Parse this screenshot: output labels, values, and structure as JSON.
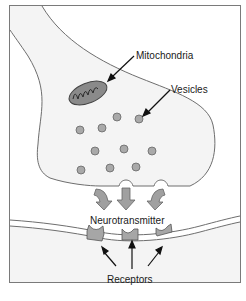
{
  "diagram": {
    "labels": {
      "mitochondria": "Mitochondria",
      "vesicles": "Vesicles",
      "neurotransmitter": "Neurotransmitter",
      "receptors": "Receptors"
    },
    "colors": {
      "background": "#ffffff",
      "cell_fill": "#f4f4f4",
      "outline": "#6e6e6e",
      "vesicle_fill": "#a9a9a9",
      "mitochondria_fill": "#8a8a8a",
      "arrow_fill": "#a0a0a0",
      "receptor_fill": "#a6a6a6",
      "text": "#1a1a1a"
    },
    "vesicle_count": 11,
    "release_arrow_count": 3,
    "receptor_count": 3
  }
}
